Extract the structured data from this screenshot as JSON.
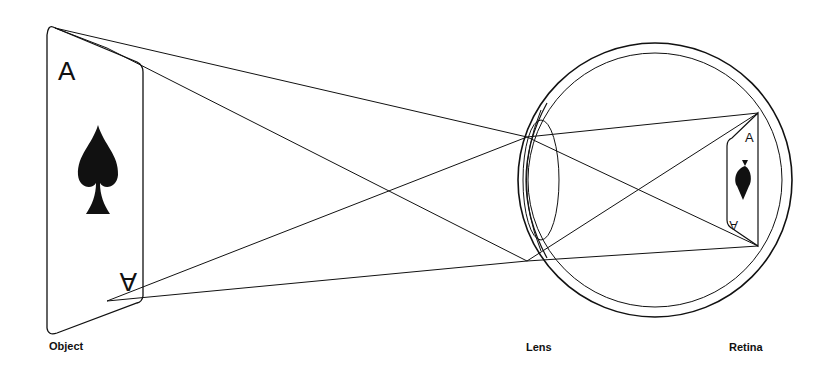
{
  "figure": {
    "type": "optics-diagram",
    "colors": {
      "background": "#ffffff",
      "stroke": "#111111"
    }
  },
  "labels": {
    "object": "Object",
    "lens": "Lens",
    "retina": "Retina"
  },
  "object_card": {
    "rank": "A",
    "suit": "spade",
    "orientation": "upright"
  },
  "retina_image_card": {
    "rank": "A",
    "suit": "spade",
    "orientation": "inverted-small"
  },
  "rays": [
    {
      "from": "object-top",
      "to": "lens-top"
    },
    {
      "from": "object-top",
      "to": "lens-bottom"
    },
    {
      "from": "object-bottom",
      "to": "lens-top"
    },
    {
      "from": "object-bottom",
      "to": "lens-bottom"
    },
    {
      "from": "lens-top",
      "to": "retina-top"
    },
    {
      "from": "lens-top",
      "to": "retina-bottom"
    },
    {
      "from": "lens-bottom",
      "to": "retina-top"
    },
    {
      "from": "lens-bottom",
      "to": "retina-bottom"
    }
  ]
}
